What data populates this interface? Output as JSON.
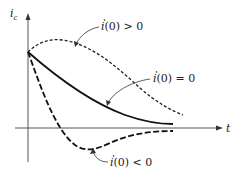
{
  "figure": {
    "y_axis_label": {
      "main": "i",
      "sub": "c"
    },
    "x_axis_label": "t",
    "curves": [
      {
        "id": "positive-slope",
        "label_var": "i",
        "label_rest": "(0) > 0",
        "style": "short-dash"
      },
      {
        "id": "zero-slope",
        "label_var": "i",
        "label_rest": "(0) = 0",
        "style": "solid"
      },
      {
        "id": "negative-slope",
        "label_var": "i",
        "label_rest": "(0) < 0",
        "style": "long-dash"
      }
    ],
    "colors": {
      "ink": "#111111",
      "axis": "#444444",
      "background": "#ffffff"
    }
  }
}
